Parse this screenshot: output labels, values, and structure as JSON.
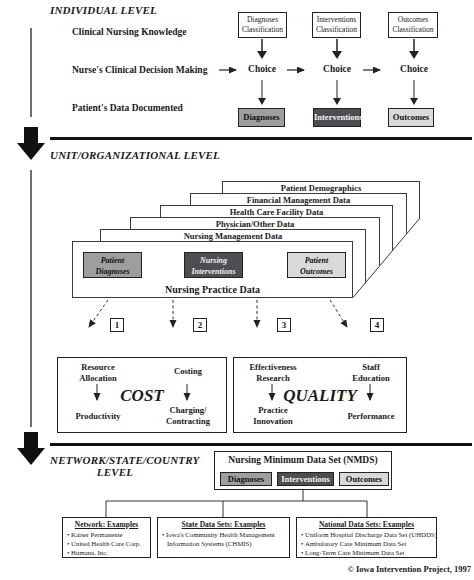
{
  "colors": {
    "diagnoses_fill": "#9e9e9e",
    "interventions_fill": "#4e4e52",
    "outcomes_fill": "#d9d9d9",
    "line_color": "#222222"
  },
  "individual": {
    "heading": "INDIVIDUAL LEVEL",
    "row_labels": [
      "Clinical Nursing Knowledge",
      "Nurse's Clinical Decision Making",
      "Patient's Data Documented"
    ],
    "classification_boxes": [
      "Diagnoses Classification",
      "Interventions Classification",
      "Outcomes Classification"
    ],
    "choices": [
      "Choice",
      "Choice",
      "Choice"
    ],
    "data_boxes": [
      "Diagnoses",
      "Interventions",
      "Outcomes"
    ]
  },
  "unit": {
    "heading": "UNIT/ORGANIZATIONAL LEVEL",
    "stack_cards": [
      "Patient Demographics",
      "Financial Management Data",
      "Health Care Facility Data",
      "Physician/Other Data",
      "Nursing Management Data"
    ],
    "front_card": {
      "title": "Nursing Practice Data",
      "boxes": [
        "Patient Diagnoses",
        "Nursing Interventions",
        "Patient Outcomes"
      ]
    },
    "branch_numbers": [
      "1",
      "2",
      "3",
      "4"
    ],
    "cost_panel": {
      "title": "COST",
      "top_left": "Resource\nAllocation",
      "top_right": "Costing",
      "bottom_left": "Productivity",
      "bottom_right": "Charging/\nContracting"
    },
    "quality_panel": {
      "title": "QUALITY",
      "top_left": "Effectiveness\nResearch",
      "top_right": "Staff\nEducation",
      "bottom_left": "Practice\nInnovation",
      "bottom_right": "Performance"
    }
  },
  "network": {
    "heading": "NETWORK/STATE/COUNTRY\nLEVEL",
    "nmds": {
      "title": "Nursing Minimum Data Set (NMDS)",
      "boxes": [
        "Diagnoses",
        "Interventions",
        "Outcomes"
      ]
    },
    "example_boxes": [
      {
        "title": "Network: Examples",
        "items": [
          "Kaiser Permanente",
          "United Health Care Corp.",
          "Humana, Inc."
        ]
      },
      {
        "title": "State Data Sets: Examples",
        "items": [
          "Iowa's Community Health Management Information Systems (CHMIS)"
        ]
      },
      {
        "title": "National Data Sets: Examples",
        "items": [
          "Uniform Hospital Discharge Data Set (UHDDS)",
          "Ambulatory Care Minimum Data Set",
          "Long-Term Care Minimum Data Set"
        ]
      }
    ]
  },
  "footer": {
    "copyright": "© Iowa Intervention Project, 1997"
  }
}
